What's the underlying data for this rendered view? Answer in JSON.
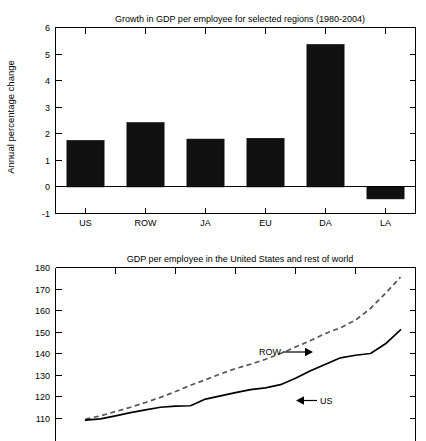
{
  "chart_data": [
    {
      "type": "bar",
      "id": "growth-bar-chart",
      "title": "Growth in GDP per employee for selected regions (1980-2004)",
      "xlabel": "",
      "ylabel": "Annual percentage change",
      "categories": [
        "US",
        "ROW",
        "JA",
        "EU",
        "DA",
        "LA"
      ],
      "values": [
        1.75,
        2.42,
        1.8,
        1.83,
        5.36,
        -0.45
      ],
      "ylim": [
        -1,
        6
      ],
      "yticks": [
        -1,
        0,
        1,
        2,
        3,
        4,
        5,
        6
      ],
      "yticklabels": [
        "-1",
        "0",
        "1",
        "2",
        "3",
        "4",
        "5",
        "6"
      ],
      "grid": false,
      "bar_color": "#111111",
      "legend": "none"
    },
    {
      "type": "line",
      "id": "gdp-level-chart",
      "title": "GDP per employee in the United States and rest of world",
      "xlabel": "",
      "ylabel": "",
      "ylim": [
        110,
        180
      ],
      "yticks": [
        110,
        120,
        130,
        140,
        150,
        160,
        170,
        180
      ],
      "yticklabels": [
        "110",
        "120",
        "130",
        "140",
        "150",
        "160",
        "170",
        "180"
      ],
      "xlim": [
        0,
        24
      ],
      "grid": false,
      "legend": "inline-annotations",
      "annotations": [
        {
          "text": "ROW",
          "arrow": "right",
          "x": 13.0,
          "y": 147.5
        },
        {
          "text": "US",
          "arrow": "left",
          "x": 17.2,
          "y": 128.5
        }
      ],
      "series": [
        {
          "name": "ROW",
          "style": "dashed",
          "color": "#555555",
          "x": [
            2.0,
            3.0,
            4.0,
            5.0,
            6.0,
            7.0,
            8.0,
            9.0,
            10.0,
            11.0,
            12.0,
            13.0,
            14.0,
            15.0,
            16.0,
            17.0,
            18.0,
            19.0,
            20.0,
            21.0,
            22.0,
            23.0
          ],
          "y": [
            109.5,
            111.0,
            113.0,
            115.0,
            117.2,
            119.6,
            122.3,
            125.2,
            127.8,
            130.5,
            133.0,
            135.0,
            137.3,
            140.0,
            143.0,
            146.0,
            149.3,
            152.0,
            155.5,
            161.0,
            168.0,
            175.5
          ]
        },
        {
          "name": "US",
          "style": "solid",
          "color": "#000000",
          "x": [
            2.0,
            3.0,
            4.0,
            5.0,
            6.0,
            7.0,
            8.0,
            9.0,
            10.0,
            11.0,
            12.0,
            13.0,
            14.0,
            15.0,
            16.0,
            17.0,
            18.0,
            19.0,
            20.0,
            21.0,
            22.0,
            23.0
          ],
          "y": [
            109.0,
            109.6,
            111.0,
            112.5,
            113.8,
            115.0,
            115.5,
            115.7,
            118.8,
            120.3,
            121.8,
            123.2,
            124.0,
            125.5,
            128.5,
            132.0,
            135.0,
            138.0,
            139.2,
            140.0,
            144.5,
            151.0
          ]
        }
      ]
    }
  ],
  "figure": {
    "top_chart": {
      "title": "Growth in GDP per employee for selected regions (1980-2004)",
      "ylabel": "Annual percentage change",
      "yticklabels": [
        "6",
        "5",
        "4",
        "3",
        "2",
        "1",
        "0",
        "-1"
      ],
      "xticklabels": [
        "US",
        "ROW",
        "JA",
        "EU",
        "DA",
        "LA"
      ]
    },
    "bottom_chart": {
      "title": "GDP per employee in the United States and rest of world",
      "yticklabels": [
        "180",
        "170",
        "160",
        "150",
        "140",
        "130",
        "120",
        "110"
      ],
      "annotation_row": "ROW",
      "annotation_us": "US"
    }
  }
}
